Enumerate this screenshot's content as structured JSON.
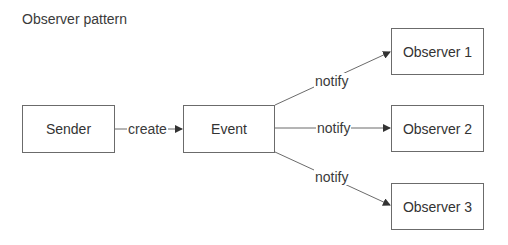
{
  "title": "Observer pattern",
  "nodes": {
    "sender": "Sender",
    "event": "Event",
    "observer1": "Observer 1",
    "observer2": "Observer 2",
    "observer3": "Observer 3"
  },
  "edges": [
    {
      "from": "Sender",
      "to": "Event",
      "label": "create"
    },
    {
      "from": "Event",
      "to": "Observer 1",
      "label": "notify"
    },
    {
      "from": "Event",
      "to": "Observer 2",
      "label": "notify"
    },
    {
      "from": "Event",
      "to": "Observer 3",
      "label": "notify"
    }
  ],
  "colors": {
    "stroke": "#6b6b6b",
    "text": "#333333"
  }
}
